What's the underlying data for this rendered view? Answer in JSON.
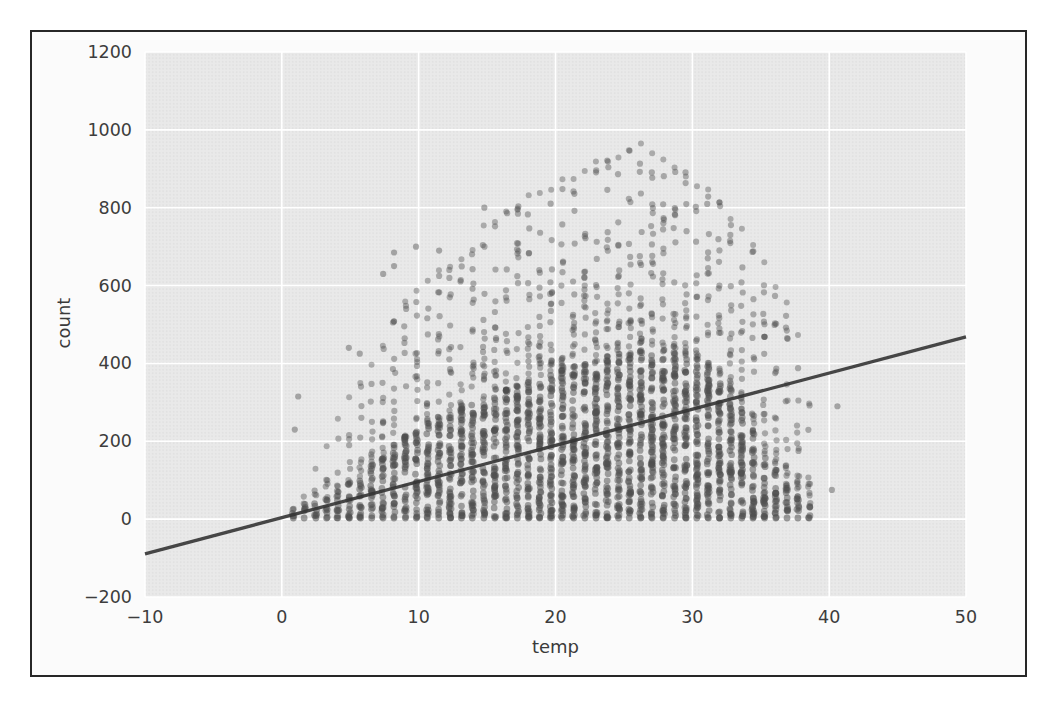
{
  "page": {
    "background": "#ffffff"
  },
  "figure": {
    "border_color": "#272727",
    "background": "#fbfbfb"
  },
  "chart_data": {
    "type": "scatter",
    "title": "",
    "xlabel": "temp",
    "ylabel": "count",
    "xlim": [
      -10,
      50
    ],
    "ylim": [
      -200,
      1200
    ],
    "grid": "on",
    "legend": "none",
    "plot_bg": "#e9e9e9",
    "halftone_dot_color": "#dedede",
    "grid_color": "#ffffff",
    "point_color": "#4f4f4f",
    "line_color": "#333333",
    "xticks": [
      {
        "v": -10,
        "label": "−10"
      },
      {
        "v": 0,
        "label": "0"
      },
      {
        "v": 10,
        "label": "10"
      },
      {
        "v": 20,
        "label": "20"
      },
      {
        "v": 30,
        "label": "30"
      },
      {
        "v": 40,
        "label": "40"
      },
      {
        "v": 50,
        "label": "50"
      }
    ],
    "yticks": [
      {
        "v": 1200,
        "label": "1200"
      },
      {
        "v": 1000,
        "label": "1000"
      },
      {
        "v": 800,
        "label": "800"
      },
      {
        "v": 600,
        "label": "600"
      },
      {
        "v": 400,
        "label": "400"
      },
      {
        "v": 200,
        "label": "200"
      },
      {
        "v": 0,
        "label": "0"
      },
      {
        "v": -200,
        "label": "−200"
      }
    ],
    "regression_line": {
      "x": [
        -10,
        50
      ],
      "y": [
        -89,
        468
      ]
    },
    "temp_step": 0.82,
    "columns_schema": [
      "temp",
      "dense_top_count",
      "max_count"
    ],
    "columns": [
      [
        0.82,
        25,
        55
      ],
      [
        1.64,
        35,
        80
      ],
      [
        2.46,
        45,
        130
      ],
      [
        3.28,
        55,
        190
      ],
      [
        4.1,
        70,
        260
      ],
      [
        4.92,
        90,
        320
      ],
      [
        5.74,
        110,
        360
      ],
      [
        6.56,
        140,
        400
      ],
      [
        7.38,
        160,
        450
      ],
      [
        8.2,
        190,
        520
      ],
      [
        9.02,
        210,
        560
      ],
      [
        9.84,
        230,
        600
      ],
      [
        10.66,
        245,
        620
      ],
      [
        11.48,
        255,
        645
      ],
      [
        12.3,
        265,
        660
      ],
      [
        13.12,
        280,
        680
      ],
      [
        13.94,
        295,
        700
      ],
      [
        14.76,
        305,
        760
      ],
      [
        15.58,
        315,
        780
      ],
      [
        16.4,
        330,
        800
      ],
      [
        17.22,
        340,
        815
      ],
      [
        18.04,
        350,
        835
      ],
      [
        18.86,
        360,
        855
      ],
      [
        19.68,
        370,
        870
      ],
      [
        20.5,
        380,
        880
      ],
      [
        21.32,
        390,
        890
      ],
      [
        22.14,
        395,
        905
      ],
      [
        22.96,
        400,
        920
      ],
      [
        23.78,
        410,
        935
      ],
      [
        24.6,
        415,
        950
      ],
      [
        25.42,
        420,
        965
      ],
      [
        26.24,
        430,
        975
      ],
      [
        27.06,
        430,
        960
      ],
      [
        27.88,
        430,
        950
      ],
      [
        28.7,
        425,
        930
      ],
      [
        29.52,
        420,
        900
      ],
      [
        30.34,
        410,
        880
      ],
      [
        31.16,
        390,
        850
      ],
      [
        31.98,
        370,
        820
      ],
      [
        32.8,
        340,
        790
      ],
      [
        33.62,
        280,
        760
      ],
      [
        34.44,
        220,
        720
      ],
      [
        35.26,
        165,
        680
      ],
      [
        36.08,
        125,
        610
      ],
      [
        36.9,
        85,
        560
      ],
      [
        37.72,
        55,
        480
      ],
      [
        38.54,
        30,
        300
      ]
    ],
    "outliers": [
      [
        0.95,
        230
      ],
      [
        1.2,
        315
      ],
      [
        4.9,
        440
      ],
      [
        5.7,
        425
      ],
      [
        7.4,
        630
      ],
      [
        8.2,
        650
      ],
      [
        8.2,
        685
      ],
      [
        9.8,
        700
      ],
      [
        11.5,
        690
      ],
      [
        14.8,
        800
      ],
      [
        40.2,
        75
      ],
      [
        40.6,
        290
      ]
    ]
  }
}
